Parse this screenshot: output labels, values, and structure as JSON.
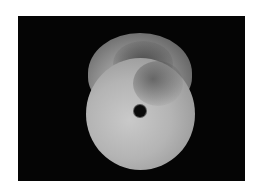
{
  "image": {
    "subject": "jade disc pendant with central hole",
    "background_color": "#050505",
    "page_color": "#ffffff"
  }
}
